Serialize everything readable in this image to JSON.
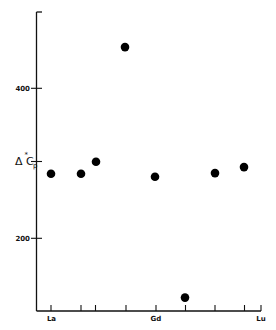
{
  "chart_data": {
    "type": "scatter",
    "title": "",
    "xlabel": "",
    "ylabel": "ΔC_p",
    "ylabel_parts": {
      "delta": "Δ",
      "star": "*",
      "letter": "C",
      "subscript": "p"
    },
    "ylim": [
      103,
      502
    ],
    "yticks": [
      {
        "value": 200,
        "label": "200"
      },
      {
        "value": 300,
        "label": ""
      },
      {
        "value": 400,
        "label": "400"
      },
      {
        "value": 500,
        "label": ""
      }
    ],
    "xticks": [
      {
        "pos": 51,
        "label": "La"
      },
      {
        "pos": 81,
        "label": ""
      },
      {
        "pos": 95,
        "label": ""
      },
      {
        "pos": 126,
        "label": ""
      },
      {
        "pos": 156,
        "label": "Gd"
      },
      {
        "pos": 185,
        "label": ""
      },
      {
        "pos": 215,
        "label": ""
      },
      {
        "pos": 244,
        "label": ""
      },
      {
        "pos": 261,
        "label": "Lu"
      }
    ],
    "points": [
      {
        "x": 51,
        "y": 286
      },
      {
        "x": 81,
        "y": 286
      },
      {
        "x": 96,
        "y": 302
      },
      {
        "x": 125,
        "y": 455
      },
      {
        "x": 155,
        "y": 282
      },
      {
        "x": 185,
        "y": 121
      },
      {
        "x": 215,
        "y": 287
      },
      {
        "x": 244,
        "y": 295
      }
    ],
    "grid": false,
    "legend": null,
    "marker": {
      "shape": "filled-circle",
      "color": "#000000"
    }
  },
  "labels": {
    "y_400": "400",
    "y_200": "200",
    "x_la": "La",
    "x_gd": "Gd",
    "x_lu": "Lu",
    "y_delta": "Δ",
    "y_star": "*",
    "y_letter": "C",
    "y_sub": "p"
  },
  "colors": {
    "ink": "#111111",
    "background": "#ffffff"
  }
}
